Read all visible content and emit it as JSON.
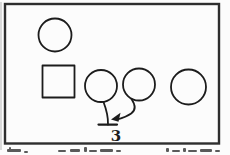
{
  "figure": {
    "count_label": "3",
    "shape_inventory": {
      "top_left_shape": "circle",
      "left_shape": "square",
      "bottom_row_shapes": [
        "circle",
        "circle",
        "circle"
      ],
      "bottom_row_count": 3
    },
    "connectors": [
      "line-with-t-bar-end",
      "curved-arrow"
    ],
    "caption": {
      "visible": "clipped letter tops only (illegible, cut off at image bottom)"
    }
  },
  "colors": {
    "ink": "#1c1c1c",
    "frame": "#2e2e2e",
    "background": "#fcfcfc",
    "caption_ink": "#5a5a5a"
  }
}
